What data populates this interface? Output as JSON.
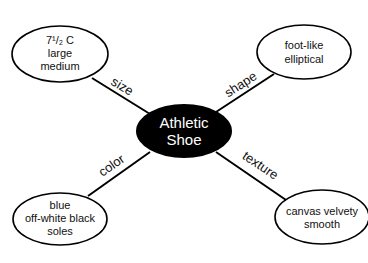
{
  "diagram": {
    "type": "concept-web",
    "center": {
      "lines": [
        "Athletic",
        "Shoe"
      ],
      "fill": "#000000",
      "text_color": "#ffffff"
    },
    "branches": [
      {
        "label": "size",
        "node_lines": [
          "7¹/₂ C",
          "large",
          "medium"
        ]
      },
      {
        "label": "shape",
        "node_lines": [
          "foot-like",
          "elliptical"
        ]
      },
      {
        "label": "color",
        "node_lines": [
          "blue",
          "off-white black",
          "soles"
        ]
      },
      {
        "label": "texture",
        "node_lines": [
          "canvas velvety",
          "smooth"
        ]
      }
    ]
  }
}
